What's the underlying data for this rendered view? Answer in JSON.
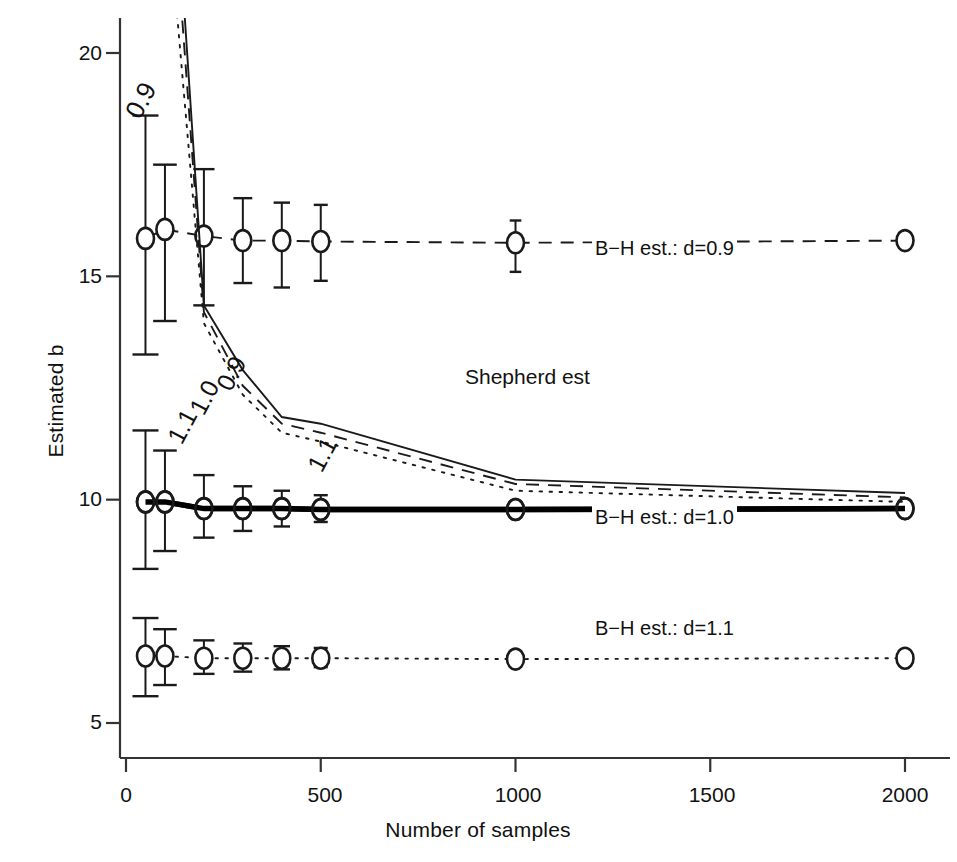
{
  "chart_data": {
    "type": "line",
    "title": "",
    "xlabel": "Number of samples",
    "ylabel": "Estimated b",
    "xlim": [
      0,
      2120
    ],
    "ylim": [
      4.6,
      21.2
    ],
    "xticks": [
      0,
      500,
      1000,
      1500,
      2000
    ],
    "xticklabels": [
      "0",
      "500",
      "1000",
      "1500",
      "2000"
    ],
    "yticks": [
      5,
      10,
      15,
      20
    ],
    "yticklabels": [
      "5",
      "10",
      "15",
      "20"
    ],
    "grid": false,
    "legend_position": "inline-right",
    "x": [
      50,
      100,
      200,
      300,
      400,
      500,
      1000,
      2000
    ],
    "series": [
      {
        "name": "B-H est.: d=0.9",
        "label": "B−H est.: d=0.9",
        "style": "dashed",
        "marker": "open-circle",
        "values": [
          15.85,
          16.05,
          15.9,
          15.8,
          15.8,
          15.78,
          15.75,
          15.8
        ],
        "err_upper": [
          18.6,
          17.5,
          17.4,
          16.75,
          16.65,
          16.6,
          16.25,
          15.95
        ],
        "err_lower": [
          13.25,
          14.0,
          14.35,
          14.85,
          14.75,
          14.9,
          15.1,
          15.6
        ],
        "label_x": 1230,
        "label_y": 15.05
      },
      {
        "name": "B-H est.: d=1.0",
        "label": "B−H est.: d=1.0",
        "style": "thick-solid",
        "marker": "open-circle",
        "values": [
          9.95,
          9.95,
          9.8,
          9.8,
          9.8,
          9.78,
          9.78,
          9.8
        ],
        "err_upper": [
          11.55,
          11.1,
          10.55,
          10.3,
          10.2,
          10.1,
          9.95,
          9.85
        ],
        "err_lower": [
          8.45,
          8.85,
          9.15,
          9.3,
          9.4,
          9.5,
          9.65,
          9.75
        ],
        "label_x": 1230,
        "label_y": 9.3
      },
      {
        "name": "B-H est.: d=1.1",
        "label": "B−H est.: d=1.1",
        "style": "dotted",
        "marker": "open-circle",
        "values": [
          6.5,
          6.5,
          6.45,
          6.45,
          6.45,
          6.45,
          6.43,
          6.45
        ],
        "err_upper": [
          7.35,
          7.1,
          6.85,
          6.78,
          6.72,
          6.68,
          6.58,
          6.5
        ],
        "err_lower": [
          5.6,
          5.85,
          6.1,
          6.15,
          6.2,
          6.25,
          6.3,
          6.4
        ],
        "label_x": 1230,
        "label_y": 6.6
      },
      {
        "name": "Shepherd est: 0.9",
        "label": "0.9",
        "style": "solid",
        "marker": "none",
        "values": [
          36.0,
          27.5,
          14.35,
          12.9,
          11.85,
          11.7,
          10.45,
          10.15
        ],
        "label_x": 425,
        "label_y": 12.6,
        "label_rotation": -58
      },
      {
        "name": "Shepherd est: 1.0",
        "label": "1.0",
        "style": "dashed",
        "marker": "none",
        "values": [
          34.0,
          26.0,
          14.2,
          12.55,
          11.7,
          11.5,
          10.35,
          10.05
        ],
        "label_x": 400,
        "label_y": 12.1,
        "label_rotation": -58
      },
      {
        "name": "Shepherd est: 1.1",
        "label": "1.1",
        "style": "dotted",
        "marker": "none",
        "values": [
          30.0,
          24.0,
          13.95,
          12.35,
          11.5,
          11.3,
          10.2,
          9.95
        ],
        "label_x": 370,
        "label_y": 11.5,
        "label_rotation": -58
      }
    ],
    "annotations": [
      {
        "text": "Shepherd est",
        "x": 660,
        "y": 12.55
      }
    ]
  },
  "axes": {
    "ylabel": "Estimated b",
    "xlabel": "Number of samples"
  },
  "colors": {
    "ink": "#1a1a1a",
    "axis": "#333333",
    "background": "#ffffff"
  }
}
